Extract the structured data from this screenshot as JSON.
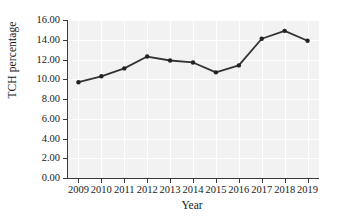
{
  "chart_data": {
    "type": "line",
    "title": "",
    "xlabel": "Year",
    "ylabel": "TCH percentage",
    "categories": [
      "2009",
      "2010",
      "2011",
      "2012",
      "2013",
      "2014",
      "2015",
      "2016",
      "2017",
      "2018",
      "2019"
    ],
    "values": [
      9.7,
      10.3,
      11.1,
      12.3,
      11.9,
      11.7,
      10.7,
      11.4,
      14.1,
      14.9,
      13.9
    ],
    "series": [
      {
        "name": "TCH percentage",
        "values": [
          9.7,
          10.3,
          11.1,
          12.3,
          11.9,
          11.7,
          10.7,
          11.4,
          14.1,
          14.9,
          13.9
        ]
      }
    ],
    "ylim": [
      0.0,
      16.0
    ],
    "ytick_labels": [
      "0.00",
      "2.00",
      "4.00",
      "6.00",
      "8.00",
      "10.00",
      "12.00",
      "14.00",
      "16.00"
    ],
    "ytick_values": [
      0,
      2,
      4,
      6,
      8,
      10,
      12,
      14,
      16
    ],
    "xtick_labels": [
      "2009",
      "2010",
      "2011",
      "2012",
      "2013",
      "2014",
      "2015",
      "2016",
      "2017",
      "2018",
      "2019"
    ],
    "grid": true,
    "grid_color": "#ffffff",
    "plot_background": "#f2f2f2",
    "line_color": "#333333",
    "marker_color": "#222222",
    "marker": "circle",
    "legend": "none"
  }
}
